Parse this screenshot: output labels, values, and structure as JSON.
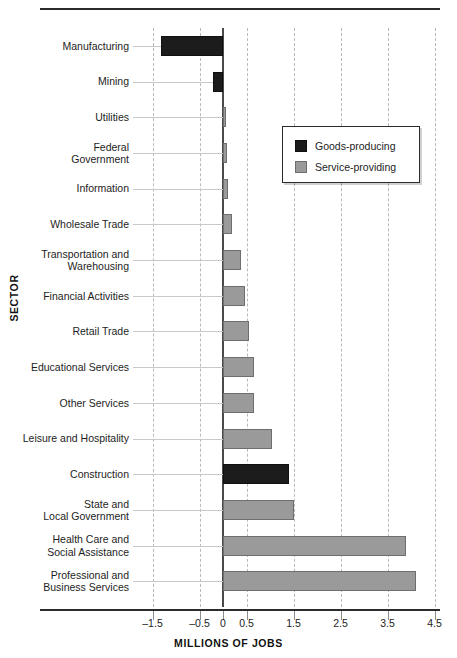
{
  "chart_data": {
    "type": "bar",
    "orientation": "horizontal",
    "title": "",
    "xlabel": "MILLIONS OF JOBS",
    "ylabel": "SECTOR",
    "xlim": [
      -1.75,
      4.75
    ],
    "grid": true,
    "xticks": [
      -1.5,
      -0.5,
      0,
      0.5,
      1.5,
      2.5,
      3.5,
      4.5
    ],
    "xticklabels": [
      "–1.5",
      "–0.5",
      "0",
      "0.5",
      "1.5",
      "2.5",
      "3.5",
      "4.5"
    ],
    "legend": {
      "position": "upper-center-right",
      "entries": [
        {
          "label": "Goods-producing",
          "color": "#1c1c1c"
        },
        {
          "label": "Service-providing",
          "color": "#9a9a9a"
        }
      ]
    },
    "categories": [
      "Manufacturing",
      "Mining",
      "Utilities",
      "Federal\nGovernment",
      "Information",
      "Wholesale Trade",
      "Transportation and\nWarehousing",
      "Financial Activities",
      "Retail Trade",
      "Educational Services",
      "Other Services",
      "Leisure and Hospitality",
      "Construction",
      "State and\nLocal Government",
      "Health Care and\nSocial Assistance",
      "Professional and\nBusiness Services"
    ],
    "values": [
      -1.32,
      -0.22,
      0.06,
      0.09,
      0.11,
      0.2,
      0.38,
      0.47,
      0.55,
      0.65,
      0.67,
      1.05,
      1.4,
      1.52,
      3.9,
      4.1
    ],
    "groups": [
      "Goods-producing",
      "Goods-producing",
      "Service-providing",
      "Service-providing",
      "Service-providing",
      "Service-providing",
      "Service-providing",
      "Service-providing",
      "Service-providing",
      "Service-providing",
      "Service-providing",
      "Service-providing",
      "Goods-producing",
      "Service-providing",
      "Service-providing",
      "Service-providing"
    ]
  }
}
